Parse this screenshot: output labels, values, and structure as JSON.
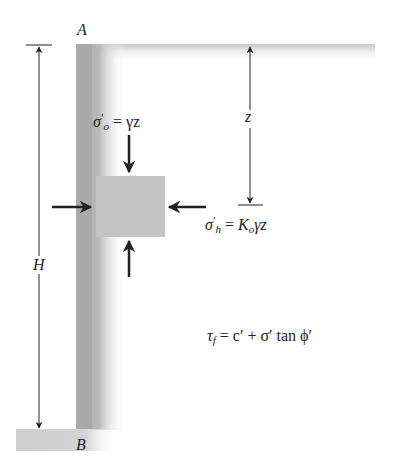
{
  "diagram": {
    "point_top": "A",
    "point_bottom": "B",
    "dim_height": "H",
    "dim_depth": "z",
    "vertical_stress": {
      "symbol": "σ",
      "subscript": "o",
      "prime": "′",
      "rhs": "= γz"
    },
    "horizontal_stress": {
      "symbol": "σ",
      "subscript": "h",
      "prime": "′",
      "rhs_k": "K",
      "rhs_k_sub": "o",
      "rhs_tail": "γz"
    },
    "shear_strength": {
      "lhs": "τ",
      "lhs_sub": "f",
      "rhs": "= c′ + σ′ tan ϕ′"
    },
    "colors": {
      "wall": "#b3b3b3",
      "ground": "#c8c8c8",
      "element": "#c4c4c4",
      "arrow": "#222222"
    }
  }
}
